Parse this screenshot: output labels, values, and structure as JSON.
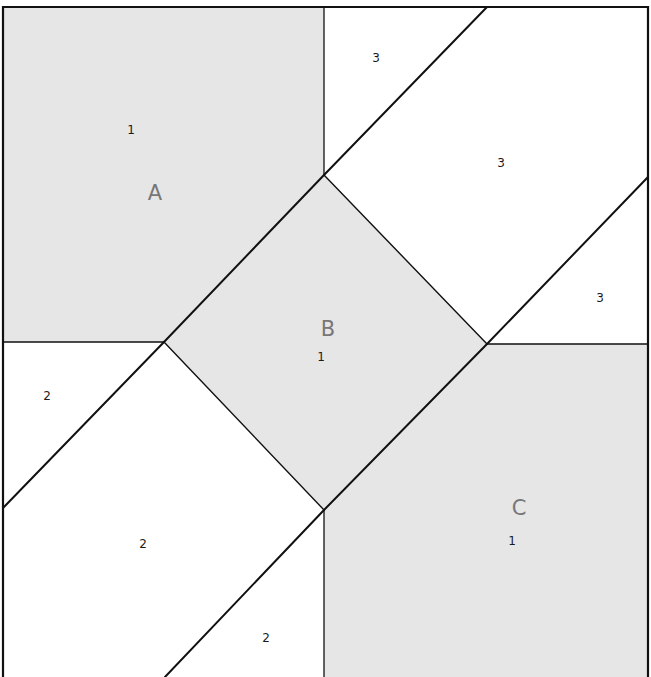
{
  "diagram": {
    "type": "quilt-block-piecing-diagram",
    "colors": {
      "shaded_fill": "#e6e6e6",
      "background_fill": "#ffffff",
      "line": "#111111",
      "unit_label": "#777777",
      "piece_label": "#1a1a1a"
    },
    "units": [
      {
        "id": "A",
        "label": "A",
        "x": 155,
        "y": 200
      },
      {
        "id": "B",
        "label": "B",
        "x": 328,
        "y": 336
      },
      {
        "id": "C",
        "label": "C",
        "x": 519,
        "y": 515
      }
    ],
    "pieces": [
      {
        "label": "1",
        "x": 131,
        "y": 134
      },
      {
        "label": "3",
        "x": 376,
        "y": 62
      },
      {
        "label": "3",
        "x": 501,
        "y": 167
      },
      {
        "label": "3",
        "x": 600,
        "y": 302
      },
      {
        "label": "1",
        "x": 321,
        "y": 361
      },
      {
        "label": "2",
        "x": 47,
        "y": 400
      },
      {
        "label": "2",
        "x": 143,
        "y": 548
      },
      {
        "label": "2",
        "x": 266,
        "y": 642
      },
      {
        "label": "1",
        "x": 512,
        "y": 545
      }
    ]
  }
}
